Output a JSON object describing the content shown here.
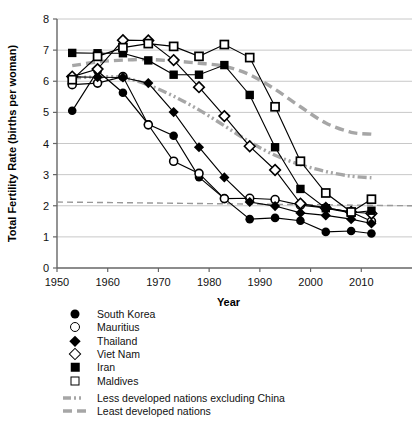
{
  "chart_data": {
    "type": "line",
    "title": "",
    "xlabel": "Year",
    "ylabel": "Total Fertility Rate (births per woman)",
    "xlim": [
      1950,
      2020
    ],
    "ylim": [
      0,
      8
    ],
    "xticks": [
      1950,
      1960,
      1970,
      1980,
      1990,
      2000,
      2010
    ],
    "yticks": [
      0,
      1,
      2,
      3,
      4,
      5,
      6,
      7,
      8
    ],
    "grid": "horizontal",
    "legend_position": "below-left",
    "series": [
      {
        "name": "South Korea",
        "marker": "circle-filled",
        "x": [
          1953,
          1958,
          1963,
          1968,
          1973,
          1978,
          1983,
          1988,
          1993,
          1998,
          2003,
          2008,
          2012
        ],
        "values": [
          5.05,
          6.33,
          5.63,
          4.62,
          4.25,
          2.92,
          2.23,
          1.57,
          1.61,
          1.52,
          1.16,
          1.19,
          1.11
        ]
      },
      {
        "name": "Mauritius",
        "marker": "circle-open",
        "x": [
          1953,
          1958,
          1963,
          1968,
          1973,
          1978,
          1983,
          1988,
          1993,
          1998,
          2003,
          2008,
          2012
        ],
        "values": [
          5.89,
          5.94,
          6.15,
          4.6,
          3.43,
          3.04,
          2.23,
          2.24,
          2.2,
          2.02,
          1.93,
          1.8,
          1.5
        ]
      },
      {
        "name": "Thailand",
        "marker": "diamond-filled",
        "x": [
          1953,
          1958,
          1963,
          1968,
          1973,
          1978,
          1983,
          1988,
          1993,
          1998,
          2003,
          2008,
          2012
        ],
        "values": [
          6.14,
          6.13,
          6.12,
          5.94,
          5.01,
          3.88,
          2.91,
          2.12,
          1.99,
          1.77,
          1.69,
          1.57,
          1.43
        ]
      },
      {
        "name": "Viet Nam",
        "marker": "diamond-open",
        "x": [
          1953,
          1958,
          1963,
          1968,
          1973,
          1978,
          1983,
          1988,
          1993,
          1998,
          2003,
          2008,
          2012
        ],
        "values": [
          6.15,
          6.39,
          7.32,
          7.31,
          6.68,
          5.81,
          4.88,
          3.91,
          3.15,
          2.07,
          1.93,
          1.8,
          1.75
        ]
      },
      {
        "name": "Iran",
        "marker": "square-filled",
        "x": [
          1953,
          1958,
          1963,
          1968,
          1973,
          1978,
          1983,
          1988,
          1993,
          1998,
          2003,
          2008,
          2012
        ],
        "values": [
          6.91,
          6.9,
          6.9,
          6.67,
          6.21,
          6.21,
          6.52,
          5.56,
          3.88,
          2.54,
          1.92,
          1.77,
          1.84
        ]
      },
      {
        "name": "Maldives",
        "marker": "square-open",
        "x": [
          1953,
          1958,
          1963,
          1968,
          1973,
          1978,
          1983,
          1988,
          1993,
          1998,
          2003,
          2008,
          2012
        ],
        "values": [
          6.05,
          6.8,
          7.08,
          7.21,
          7.12,
          6.8,
          7.18,
          6.76,
          5.18,
          3.43,
          2.41,
          1.8,
          2.21
        ]
      },
      {
        "name": "Less developed nations excluding China",
        "marker": "none",
        "style": "dash-dot",
        "color": "#a6a6a6",
        "x": [
          1953,
          1958,
          1963,
          1968,
          1973,
          1978,
          1983,
          1988,
          1993,
          1998,
          2003,
          2008,
          2012
        ],
        "values": [
          6.1,
          6.14,
          6.12,
          5.88,
          5.52,
          5.08,
          4.57,
          4.05,
          3.62,
          3.32,
          3.1,
          2.95,
          2.9
        ]
      },
      {
        "name": "Least developed nations",
        "marker": "none",
        "style": "dashed",
        "color": "#a6a6a6",
        "x": [
          1953,
          1958,
          1963,
          1968,
          1973,
          1978,
          1983,
          1988,
          1993,
          1998,
          2003,
          2008,
          2012
        ],
        "values": [
          6.5,
          6.62,
          6.68,
          6.7,
          6.65,
          6.58,
          6.48,
          6.21,
          5.74,
          5.18,
          4.66,
          4.36,
          4.3
        ]
      },
      {
        "name": "Replacement level reference",
        "marker": "none",
        "style": "dashed-thin",
        "color": "#999999",
        "x": [
          1950,
          2020
        ],
        "values": [
          2.12,
          2.0
        ]
      }
    ]
  },
  "legend": {
    "items": [
      {
        "label": "South Korea",
        "key": "circle-filled"
      },
      {
        "label": "Mauritius",
        "key": "circle-open"
      },
      {
        "label": "Thailand",
        "key": "diamond-filled"
      },
      {
        "label": "Viet Nam",
        "key": "diamond-open"
      },
      {
        "label": "Iran",
        "key": "square-filled"
      },
      {
        "label": "Maldives",
        "key": "square-open"
      },
      {
        "label": "Less developed nations excluding China",
        "key": "line-dash-dot"
      },
      {
        "label": "Least developed nations",
        "key": "line-dashed"
      }
    ]
  },
  "axes": {
    "x_title": "Year",
    "y_title": "Total Fertility Rate (births per woman)",
    "x_tick_labels": [
      "1950",
      "1960",
      "1970",
      "1980",
      "1990",
      "2000",
      "2010"
    ],
    "y_tick_labels": [
      "0",
      "1",
      "2",
      "3",
      "4",
      "5",
      "6",
      "7",
      "8"
    ]
  },
  "colors": {
    "series_black": "#000000",
    "grey_reference": "#a6a6a6",
    "gridline": "#c8c8c8",
    "axis": "#666666"
  }
}
